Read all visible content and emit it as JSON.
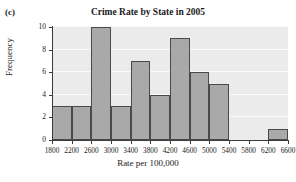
{
  "panel": {
    "label": "(c)"
  },
  "chart_data": {
    "type": "bar",
    "title": "Crime Rate by State in 2005",
    "xlabel": "Rate per 100,000",
    "ylabel": "Frequency",
    "bin_width": 400,
    "bin_edges": [
      1800,
      2200,
      2600,
      3000,
      3400,
      3800,
      4200,
      4600,
      5000,
      5400,
      5800,
      6200,
      6600
    ],
    "categories": [
      "1800-2200",
      "2200-2600",
      "2600-3000",
      "3000-3400",
      "3400-3800",
      "3800-4200",
      "4200-4600",
      "4600-5000",
      "5000-5400",
      "5400-5800",
      "5800-6200",
      "6200-6600"
    ],
    "values": [
      3,
      3,
      10,
      3,
      7,
      4,
      9,
      6,
      5,
      0,
      0,
      1
    ],
    "xtick_labels": [
      "1800",
      "2200",
      "2600",
      "3000",
      "3400",
      "3800",
      "4200",
      "4600",
      "5000",
      "5400",
      "5800",
      "6200",
      "6600"
    ],
    "ytick_labels": [
      "0",
      "2",
      "4",
      "6",
      "8",
      "10"
    ],
    "ytick_values": [
      0,
      2,
      4,
      6,
      8,
      10
    ],
    "ylim": [
      0,
      10
    ],
    "xlim": [
      1800,
      6600
    ],
    "grid": true,
    "legend": false,
    "bar_color": "#a9a9a9",
    "bar_edge_color": "#4a4a4a",
    "plot_background": "#ebebeb",
    "gridline_color": "#fbfbfb",
    "axis_color": "#3a3a3a"
  }
}
